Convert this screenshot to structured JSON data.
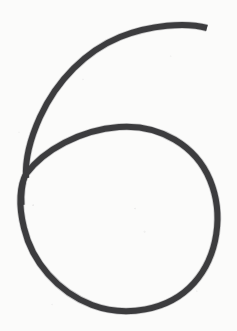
{
  "canvas": {
    "width": 237,
    "height": 331,
    "background_color": "#fbfbfa",
    "description": "Handwritten digit six drawn as a single continuous dark stroke"
  },
  "glyph": {
    "character": "6",
    "label": "handwritten-digit-six",
    "ink_color": "#3c3c3e",
    "stroke_width": 6,
    "stroke_width_tip": 5,
    "stroke_cap": "butt",
    "bounding_box": {
      "x": 19,
      "y": 24,
      "width": 197,
      "height": 285
    },
    "parts": [
      {
        "name": "upper-arc",
        "description": "Long arc sweeping from the blunt top-right terminus leftward and down the left side into the loop junction",
        "start_point": [
          207,
          28
        ],
        "end_point": [
          26,
          178
        ],
        "path": "M 207 28 C 186 22, 150 25, 120 37 C 86 51, 57 80, 40 117 C 30 139, 25 160, 26 178"
      },
      {
        "name": "lower-loop",
        "description": "Closed oval loop forming the bowl of the six, joined at the left junction",
        "junction_point": [
          26,
          174
        ],
        "extremes": {
          "left": 20,
          "right": 215,
          "top": 126,
          "bottom": 307
        },
        "path": "M 26 174 C 44 150, 80 130, 119 127 C 160 124, 196 146, 210 180 C 224 214, 218 256, 194 283 C 168 312, 124 317, 92 305 C 58 292, 32 262, 24 228 C 18 204, 20 185, 26 174"
      },
      {
        "name": "descending-tail",
        "description": "Short stroke continuing below the Y junction along the upper-left of the loop",
        "start_point": [
          26,
          172
        ],
        "end_point": [
          22,
          205
        ],
        "path": "M 26 172 C 23 182, 21 193, 22 205"
      }
    ]
  },
  "colors": {
    "ink": "#3c3c3e",
    "ink_soft_edge": "#5a5a5e",
    "paper": "#fbfbfa",
    "speckle": "#78787d"
  }
}
